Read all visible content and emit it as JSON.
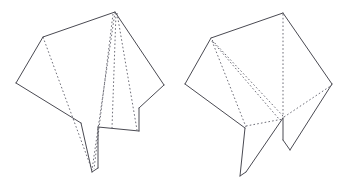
{
  "document": {
    "title": "Origami Folding Diagram",
    "background_color": "#ffffff",
    "width": 349,
    "height": 191,
    "solid_line_color": "#4a4a52",
    "dashed_line_color": "#6e6e78"
  },
  "figures": [
    {
      "id": "left-figure",
      "label": "Left origami step",
      "outline": "M 115,12 L 43,37 L 16,83 L 81,123 L 92,172 L 98,168 L 98,127 L 139,131 L 139,108 L 164,85 L 115,12 Z",
      "outline_points": [
        [
          115,
          12
        ],
        [
          43,
          37
        ],
        [
          16,
          83
        ],
        [
          81,
          123
        ],
        [
          92,
          172
        ],
        [
          98,
          168
        ],
        [
          98,
          127
        ],
        [
          139,
          131
        ],
        [
          139,
          108
        ],
        [
          164,
          85
        ]
      ],
      "solid_edges": [
        {
          "name": "top-left-edge",
          "d": "M 115,12 L 43,37"
        },
        {
          "name": "upper-left-edge",
          "d": "M 43,37 L 16,83"
        },
        {
          "name": "lower-left-edge",
          "d": "M 16,83 L 81,123"
        },
        {
          "name": "left-flap-left-edge",
          "d": "M 81,123 L 92,172"
        },
        {
          "name": "flap-bottom-tip",
          "d": "M 92,172 L 98,168"
        },
        {
          "name": "left-flap-right-edge",
          "d": "M 98,168 L 98,127"
        },
        {
          "name": "flap-notch-edge",
          "d": "M 98,127 L 139,131"
        },
        {
          "name": "inner-notch-edge",
          "d": "M 139,131 L 139,108"
        },
        {
          "name": "lower-right-edge",
          "d": "M 139,108 L 164,85"
        },
        {
          "name": "upper-right-edge",
          "d": "M 164,85 L 115,12"
        }
      ],
      "dashed_creases": [
        {
          "name": "crease-left-diagonal",
          "d": "M 43,37 L 92,170"
        },
        {
          "name": "crease-apex-far-left",
          "d": "M 115,12 L 92,170"
        },
        {
          "name": "crease-apex-left",
          "d": "M 113,14 L 94,169"
        },
        {
          "name": "crease-apex-center",
          "d": "M 116,13 L 112,128"
        },
        {
          "name": "crease-apex-right",
          "d": "M 117,13 L 137,130"
        }
      ]
    },
    {
      "id": "right-figure",
      "label": "Right origami step",
      "outline": "M 283,13 L 211,38 L 185,84 L 245,128 L 240,176 L 246,172 L 246,121 L 290,150 L 290,117 L 332,84 L 283,13 Z",
      "outline_points": [
        [
          283,
          13
        ],
        [
          211,
          38
        ],
        [
          185,
          84
        ],
        [
          245,
          128
        ],
        [
          240,
          176
        ],
        [
          246,
          172
        ],
        [
          246,
          121
        ],
        [
          290,
          150
        ],
        [
          290,
          117
        ],
        [
          332,
          84
        ]
      ],
      "solid_edges": [
        {
          "name": "top-left-edge",
          "d": "M 283,13 L 211,38"
        },
        {
          "name": "upper-left-edge",
          "d": "M 211,38 L 185,84"
        },
        {
          "name": "lower-left-edge",
          "d": "M 185,84 L 245,128"
        },
        {
          "name": "left-flap-left-edge",
          "d": "M 245,128 L 240,176"
        },
        {
          "name": "flap-bottom-tip",
          "d": "M 240,176 L 246,172"
        },
        {
          "name": "left-flap-right-edge",
          "d": "M 246,172 L 283,118"
        },
        {
          "name": "center-vertical-edge",
          "d": "M 283,118 L 283,140"
        },
        {
          "name": "right-flap-lower-left-edge",
          "d": "M 283,140 L 290,150"
        },
        {
          "name": "right-flap-lower-right-edge",
          "d": "M 290,150 L 332,84"
        },
        {
          "name": "upper-right-edge",
          "d": "M 332,84 L 283,13"
        }
      ],
      "dashed_creases": [
        {
          "name": "crease-upper-left-to-center",
          "d": "M 212,40 L 283,116"
        },
        {
          "name": "crease-upper-left-to-flap",
          "d": "M 212,41 L 246,127"
        },
        {
          "name": "crease-left-inner-diagonal",
          "d": "M 213,42 L 279,119"
        },
        {
          "name": "crease-apex-vertical",
          "d": "M 283,14 L 283,117"
        },
        {
          "name": "crease-center-to-right",
          "d": "M 284,117 L 332,85"
        },
        {
          "name": "crease-flap-horizontal",
          "d": "M 246,126 L 283,119"
        }
      ]
    }
  ]
}
